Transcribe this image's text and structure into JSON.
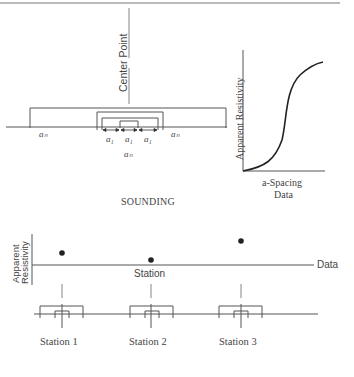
{
  "sounding": {
    "center_point_label": "Center Point",
    "a_n_left": "aₙ",
    "a_n_right": "aₙ",
    "a_1_labels": [
      "a₁",
      "a₁",
      "a₁"
    ],
    "a_n_bottom": "aₙ",
    "title": "SOUNDING"
  },
  "sounding_chart": {
    "ylabel": "Apparent Resistivity",
    "xlabel_line1": "a-Spacing",
    "xlabel_line2": "Data"
  },
  "profiling": {
    "ylabel_line1": "Apparent",
    "ylabel_line2": "Resistivity",
    "axis_label": "Station",
    "data_label": "Data",
    "stations": [
      {
        "label": "Station 1"
      },
      {
        "label": "Station 2"
      },
      {
        "label": "Station 3"
      }
    ]
  },
  "colors": {
    "line": "#555555",
    "dot": "#222222",
    "text": "#444444"
  }
}
